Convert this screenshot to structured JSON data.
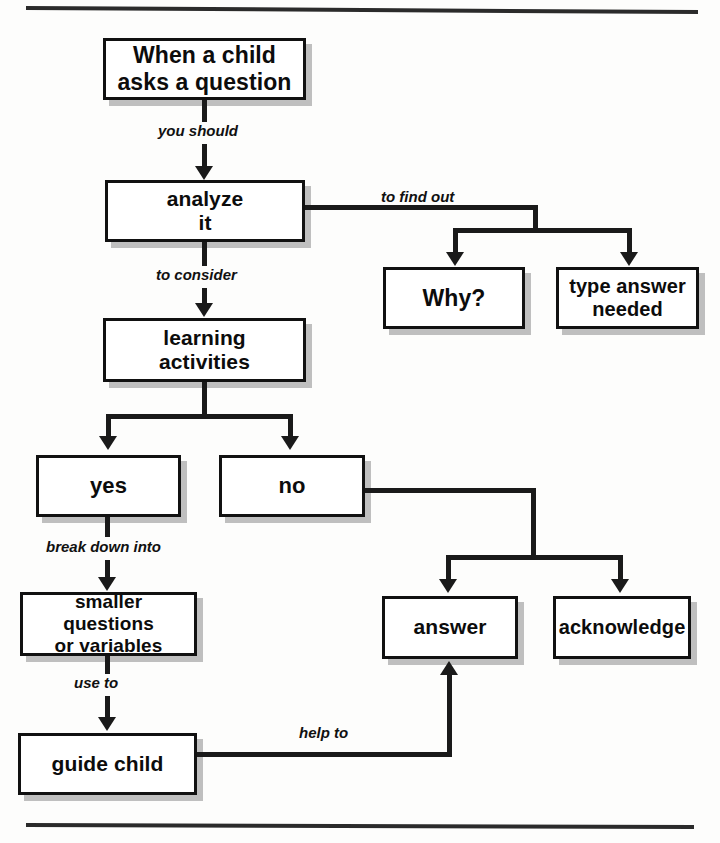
{
  "diagram": {
    "accent_color": "#111111",
    "background_color": "#fdfdfc",
    "shadow_color": "#8c8c8c"
  },
  "nodes": {
    "question": {
      "label": "When a child\nasks a question"
    },
    "analyze": {
      "label": "analyze\nit"
    },
    "why": {
      "label": "Why?"
    },
    "type_answer": {
      "label": "type answer\nneeded"
    },
    "learning": {
      "label": "learning\nactivities"
    },
    "yes": {
      "label": "yes"
    },
    "no": {
      "label": "no"
    },
    "smaller": {
      "label": "smaller questions\nor variables"
    },
    "guide": {
      "label": "guide child"
    },
    "answer": {
      "label": "answer"
    },
    "acknowledge": {
      "label": "acknowledge"
    }
  },
  "edges": {
    "you_should": {
      "label": "you should"
    },
    "to_find_out": {
      "label": "to find out"
    },
    "to_consider": {
      "label": "to consider"
    },
    "break_down_into": {
      "label": "break down into"
    },
    "use_to": {
      "label": "use to"
    },
    "help_to": {
      "label": "help to"
    }
  }
}
